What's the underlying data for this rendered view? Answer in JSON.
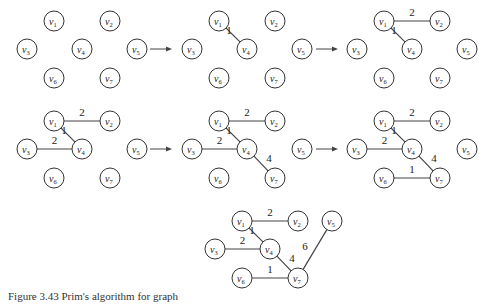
{
  "figure": {
    "caption": "Figure 3.43  Prim's algorithm for graph",
    "node_labels": [
      "v1",
      "v2",
      "v3",
      "v4",
      "v5",
      "v6",
      "v7"
    ],
    "node_positions": {
      "v1": [
        54,
        21
      ],
      "v2": [
        110,
        21
      ],
      "v3": [
        27,
        49
      ],
      "v4": [
        82,
        49
      ],
      "v5": [
        137,
        49
      ],
      "v6": [
        54,
        78
      ],
      "v7": [
        110,
        78
      ]
    },
    "node_radius": 10,
    "panels": [
      {
        "id": "step-0",
        "offset": [
          0,
          0
        ],
        "edges": []
      },
      {
        "id": "step-1",
        "offset": [
          165,
          0
        ],
        "edges": [
          {
            "from": "v1",
            "to": "v4",
            "weight": "1"
          }
        ]
      },
      {
        "id": "step-2",
        "offset": [
          330,
          0
        ],
        "edges": [
          {
            "from": "v1",
            "to": "v4",
            "weight": "1"
          },
          {
            "from": "v1",
            "to": "v2",
            "weight": "2"
          }
        ]
      },
      {
        "id": "step-3",
        "offset": [
          0,
          100
        ],
        "edges": [
          {
            "from": "v1",
            "to": "v4",
            "weight": "1"
          },
          {
            "from": "v1",
            "to": "v2",
            "weight": "2"
          },
          {
            "from": "v3",
            "to": "v4",
            "weight": "2"
          }
        ]
      },
      {
        "id": "step-4",
        "offset": [
          165,
          100
        ],
        "edges": [
          {
            "from": "v1",
            "to": "v4",
            "weight": "1"
          },
          {
            "from": "v1",
            "to": "v2",
            "weight": "2"
          },
          {
            "from": "v3",
            "to": "v4",
            "weight": "2"
          },
          {
            "from": "v4",
            "to": "v7",
            "weight": "4"
          }
        ]
      },
      {
        "id": "step-5",
        "offset": [
          330,
          100
        ],
        "edges": [
          {
            "from": "v1",
            "to": "v4",
            "weight": "1"
          },
          {
            "from": "v1",
            "to": "v2",
            "weight": "2"
          },
          {
            "from": "v3",
            "to": "v4",
            "weight": "2"
          },
          {
            "from": "v4",
            "to": "v7",
            "weight": "4"
          },
          {
            "from": "v6",
            "to": "v7",
            "weight": "1"
          }
        ]
      },
      {
        "id": "step-6",
        "offset": [
          188,
          200
        ],
        "v5_override": [
          144,
          21
        ],
        "edges": [
          {
            "from": "v1",
            "to": "v4",
            "weight": "1"
          },
          {
            "from": "v1",
            "to": "v2",
            "weight": "2"
          },
          {
            "from": "v3",
            "to": "v4",
            "weight": "2"
          },
          {
            "from": "v4",
            "to": "v7",
            "weight": "4"
          },
          {
            "from": "v6",
            "to": "v7",
            "weight": "1"
          },
          {
            "from": "v7",
            "to": "v5",
            "weight": "6"
          }
        ]
      }
    ],
    "arrows": [
      {
        "x1": 150,
        "y1": 49,
        "x2": 172,
        "y2": 49
      },
      {
        "x1": 316,
        "y1": 49,
        "x2": 338,
        "y2": 49
      },
      {
        "x1": 150,
        "y1": 149,
        "x2": 172,
        "y2": 149
      },
      {
        "x1": 316,
        "y1": 149,
        "x2": 338,
        "y2": 149
      }
    ]
  }
}
